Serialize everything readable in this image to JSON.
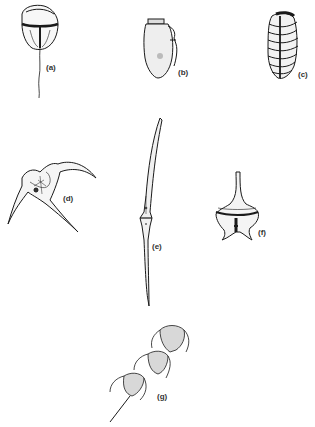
{
  "figure": {
    "background": "#ffffff",
    "ink_color": "#1a1a1a",
    "specimens": [
      {
        "id": "a",
        "label": "(a)",
        "description": "rounded cell with girdle and long trailing flagellum"
      },
      {
        "id": "b",
        "label": "(b)",
        "description": "ovoid cell with flattened apex and lateral flange"
      },
      {
        "id": "c",
        "label": "(c)",
        "description": "barrel-shaped cell with transverse bands"
      },
      {
        "id": "d",
        "label": "(d)",
        "description": "Ceratium-like cell with curved horns"
      },
      {
        "id": "e",
        "label": "(e)",
        "description": "elongate spindle cell with long apical and antapical horns"
      },
      {
        "id": "f",
        "label": "(f)",
        "description": "cell with apical horn and antapical projections"
      },
      {
        "id": "g",
        "label": "(g)",
        "description": "chain of three horned cells"
      }
    ]
  }
}
